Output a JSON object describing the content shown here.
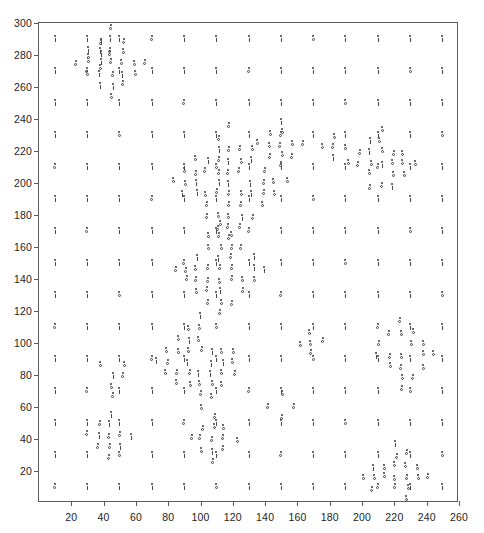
{
  "chart_data": {
    "type": "scatter",
    "title": "",
    "subtitle": "",
    "xlabel": "",
    "ylabel": "",
    "xlim": [
      0,
      260
    ],
    "ylim": [
      0,
      300
    ],
    "xticks": [
      20,
      40,
      60,
      80,
      100,
      120,
      140,
      160,
      180,
      200,
      220,
      240,
      260
    ],
    "yticks": [
      20,
      40,
      60,
      80,
      100,
      120,
      140,
      160,
      180,
      200,
      220,
      240,
      260,
      280,
      300
    ],
    "grid": false,
    "legend": null,
    "annotations": [],
    "marker": {
      "style": "point-with-error-bar",
      "size_px": 4,
      "color": "#3a3a3a",
      "variants": [
        "tick",
        "circle"
      ]
    },
    "lattice": {
      "x_start": 10,
      "x_step": 20,
      "x_count": 13,
      "y_start": 10,
      "y_step": 20,
      "y_count": 15
    },
    "clusters": [
      {
        "cx": 45,
        "cy": 275,
        "radius": 26,
        "spacing": 7,
        "variant": "circle"
      },
      {
        "cx": 118,
        "cy": 200,
        "radius": 38,
        "spacing": 7,
        "variant": "circle"
      },
      {
        "cx": 112,
        "cy": 146,
        "radius": 34,
        "spacing": 7,
        "variant": "circle"
      },
      {
        "cx": 100,
        "cy": 88,
        "radius": 34,
        "spacing": 7,
        "variant": "circle"
      },
      {
        "cx": 46,
        "cy": 80,
        "radius": 20,
        "spacing": 7,
        "variant": "circle"
      },
      {
        "cx": 212,
        "cy": 212,
        "radius": 26,
        "spacing": 7,
        "variant": "circle"
      },
      {
        "cx": 224,
        "cy": 92,
        "radius": 24,
        "spacing": 7,
        "variant": "circle"
      },
      {
        "cx": 221,
        "cy": 16,
        "radius": 22,
        "spacing": 7,
        "variant": "circle"
      },
      {
        "cx": 150,
        "cy": 224,
        "radius": 14,
        "spacing": 7,
        "variant": "circle"
      },
      {
        "cx": 183,
        "cy": 222,
        "radius": 12,
        "spacing": 7,
        "variant": "circle"
      },
      {
        "cx": 44,
        "cy": 42,
        "radius": 14,
        "spacing": 7,
        "variant": "circle"
      },
      {
        "cx": 108,
        "cy": 40,
        "radius": 14,
        "spacing": 7,
        "variant": "circle"
      },
      {
        "cx": 38,
        "cy": 280,
        "radius": 12,
        "spacing": 7,
        "variant": "circle"
      },
      {
        "cx": 168,
        "cy": 100,
        "radius": 12,
        "spacing": 7,
        "variant": "circle"
      },
      {
        "cx": 150,
        "cy": 60,
        "radius": 10,
        "spacing": 7,
        "variant": "circle"
      }
    ],
    "colors": {
      "axis": "#5a5a5a",
      "tick_label": "#1d1d1d",
      "marker": "#3a3a3a",
      "background": "#ffffff"
    },
    "point_count_estimate": 1150
  }
}
